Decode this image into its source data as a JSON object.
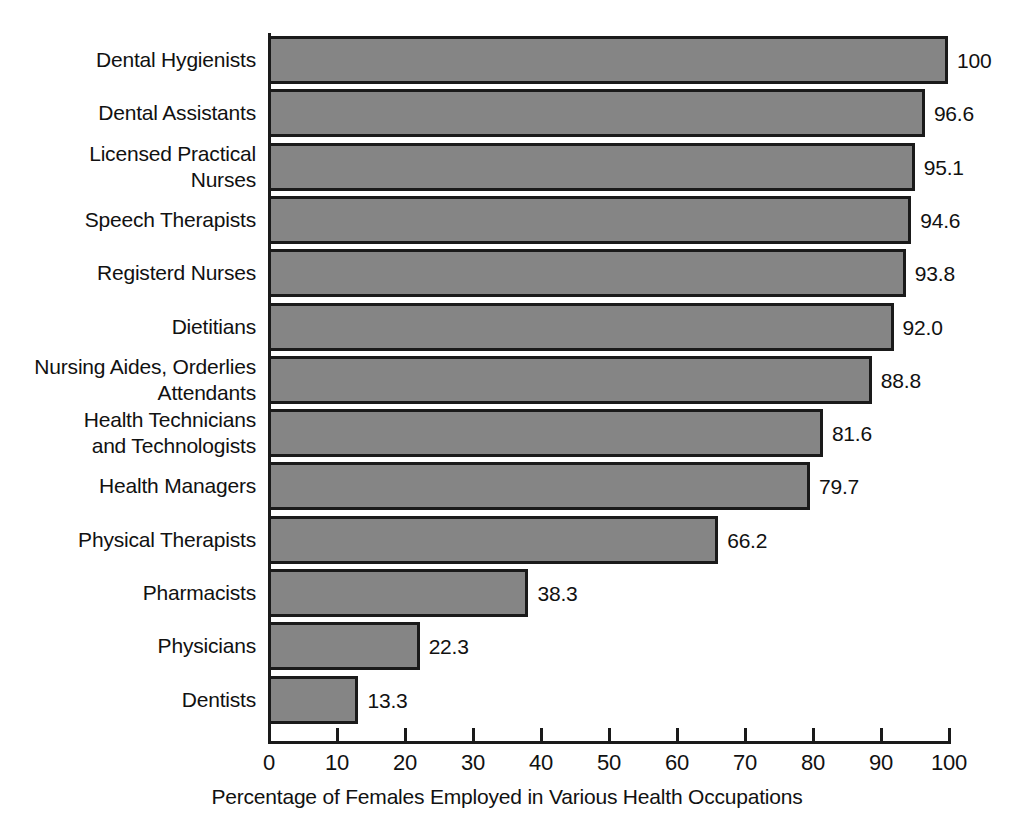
{
  "chart_data": {
    "type": "bar",
    "orientation": "horizontal",
    "title": "",
    "xlabel": "Percentage of Females Employed in Various Health Occupations",
    "ylabel": "",
    "xlim": [
      0,
      100
    ],
    "xticks": [
      0,
      10,
      20,
      30,
      40,
      50,
      60,
      70,
      80,
      90,
      100
    ],
    "xtick_labels": [
      "0",
      "10",
      "20",
      "30",
      "40",
      "50",
      "60",
      "70",
      "80",
      "90",
      "100"
    ],
    "grid": false,
    "legend": null,
    "bar_color": "#858585",
    "bar_edge_color": "#1a1a1a",
    "categories": [
      "Dental Hygienists",
      "Dental Assistants",
      "Licensed Practical\nNurses",
      "Speech Therapists",
      "Registerd Nurses",
      "Dietitians",
      "Nursing Aides, Orderlies\nAttendants",
      "Health Technicians\nand Technologists",
      "Health Managers",
      "Physical Therapists",
      "Pharmacists",
      "Physicians",
      "Dentists"
    ],
    "values": [
      100,
      96.6,
      95.1,
      94.6,
      93.8,
      92.0,
      88.8,
      81.6,
      79.7,
      66.2,
      38.3,
      22.3,
      13.3
    ],
    "value_labels": [
      "100",
      "96.6",
      "95.1",
      "94.6",
      "93.8",
      "92.0",
      "88.8",
      "81.6",
      "79.7",
      "66.2",
      "38.3",
      "22.3",
      "13.3"
    ],
    "bars": [
      {
        "category_lines": [
          "Dental Hygienists"
        ],
        "value": 100,
        "value_label": "100"
      },
      {
        "category_lines": [
          "Dental Assistants"
        ],
        "value": 96.6,
        "value_label": "96.6"
      },
      {
        "category_lines": [
          "Licensed Practical",
          "Nurses"
        ],
        "value": 95.1,
        "value_label": "95.1"
      },
      {
        "category_lines": [
          "Speech Therapists"
        ],
        "value": 94.6,
        "value_label": "94.6"
      },
      {
        "category_lines": [
          "Registerd Nurses"
        ],
        "value": 93.8,
        "value_label": "93.8"
      },
      {
        "category_lines": [
          "Dietitians"
        ],
        "value": 92.0,
        "value_label": "92.0"
      },
      {
        "category_lines": [
          "Nursing Aides, Orderlies",
          "Attendants"
        ],
        "value": 88.8,
        "value_label": "88.8"
      },
      {
        "category_lines": [
          "Health Technicians",
          "and Technologists"
        ],
        "value": 81.6,
        "value_label": "81.6"
      },
      {
        "category_lines": [
          "Health Managers"
        ],
        "value": 79.7,
        "value_label": "79.7"
      },
      {
        "category_lines": [
          "Physical Therapists"
        ],
        "value": 66.2,
        "value_label": "66.2"
      },
      {
        "category_lines": [
          "Pharmacists"
        ],
        "value": 38.3,
        "value_label": "38.3"
      },
      {
        "category_lines": [
          "Physicians"
        ],
        "value": 22.3,
        "value_label": "22.3"
      },
      {
        "category_lines": [
          "Dentists"
        ],
        "value": 13.3,
        "value_label": "13.3"
      }
    ]
  }
}
